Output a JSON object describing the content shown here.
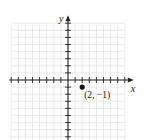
{
  "chart_data": {
    "type": "scatter",
    "title": "",
    "xlabel": "x",
    "ylabel": "y",
    "xlim": [
      -8,
      8
    ],
    "ylim": [
      -8,
      8
    ],
    "grid": true,
    "tick_interval": 1,
    "points": [
      {
        "x": 2,
        "y": -1,
        "label": "(2, −1)"
      }
    ]
  },
  "axes": {
    "x_label": "x",
    "y_label": "y"
  },
  "colors": {
    "grid": "#e3e3e3",
    "axis": "#222222",
    "point": "#111111"
  }
}
